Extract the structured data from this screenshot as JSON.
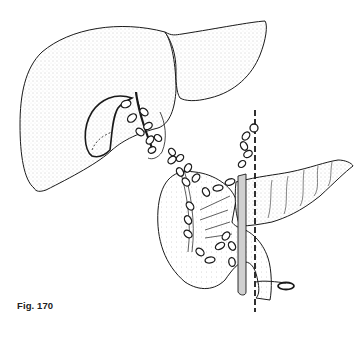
{
  "figure": {
    "caption": "Fig. 170",
    "colors": {
      "stroke": "#1a1a1a",
      "stipple": "#d8d8d8",
      "duct_shade": "#c9c9c9",
      "background": "#ffffff"
    }
  }
}
